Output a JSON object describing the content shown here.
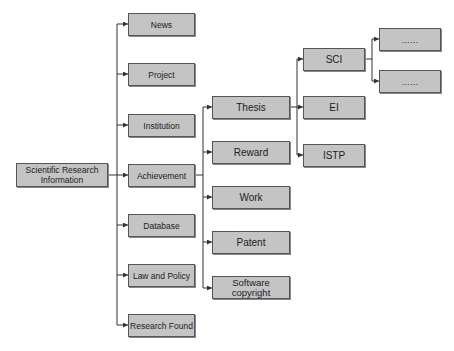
{
  "diagram": {
    "type": "tree",
    "root": {
      "label": "Scientific Research Information"
    },
    "level1": [
      {
        "label": "News"
      },
      {
        "label": "Project"
      },
      {
        "label": "Institution"
      },
      {
        "label": "Achievement"
      },
      {
        "label": "Database"
      },
      {
        "label": "Law and Policy"
      },
      {
        "label": "Research Found"
      }
    ],
    "achievement_children": [
      {
        "label": "Thesis"
      },
      {
        "label": "Reward"
      },
      {
        "label": "Work"
      },
      {
        "label": "Patent"
      },
      {
        "label": "Software copyright"
      }
    ],
    "thesis_children": [
      {
        "label": "SCI"
      },
      {
        "label": "EI"
      },
      {
        "label": "ISTP"
      }
    ],
    "sci_children": [
      {
        "label": "……"
      },
      {
        "label": "……"
      }
    ],
    "colors": {
      "box_fill": "#c4c4c4",
      "box_border": "#555555",
      "line": "#333333"
    }
  }
}
